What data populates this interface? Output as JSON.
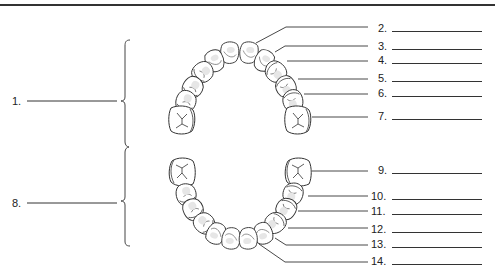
{
  "diagram": {
    "type": "dental-arch-labeling-worksheet"
  },
  "left_labels": [
    {
      "id": "1",
      "text": "1.",
      "refers_to": "upper-arch-bracket",
      "x": 12,
      "y": 95
    },
    {
      "id": "8",
      "text": "8.",
      "refers_to": "lower-arch-bracket",
      "x": 12,
      "y": 197
    }
  ],
  "right_labels": [
    {
      "id": "2",
      "text": "2.",
      "y": 24,
      "x": 378
    },
    {
      "id": "3",
      "text": "3.",
      "y": 42,
      "x": 378
    },
    {
      "id": "4",
      "text": "4.",
      "y": 56,
      "x": 378
    },
    {
      "id": "5",
      "text": "5.",
      "y": 74,
      "x": 378
    },
    {
      "id": "6",
      "text": "6.",
      "y": 89,
      "x": 378
    },
    {
      "id": "7",
      "text": "7.",
      "y": 112,
      "x": 378
    },
    {
      "id": "9",
      "text": "9.",
      "y": 166,
      "x": 378
    },
    {
      "id": "10",
      "text": "10.",
      "y": 192,
      "x": 372
    },
    {
      "id": "11",
      "text": "11.",
      "y": 207,
      "x": 372
    },
    {
      "id": "12",
      "text": "12.",
      "y": 225,
      "x": 372
    },
    {
      "id": "13",
      "text": "13.",
      "y": 240,
      "x": 372
    },
    {
      "id": "14",
      "text": "14.",
      "y": 257,
      "x": 372
    }
  ],
  "colors": {
    "ink": "#333333",
    "tooth_fill": "#ffffff",
    "tooth_shade": "#e4e4e4",
    "background": "#ffffff"
  }
}
